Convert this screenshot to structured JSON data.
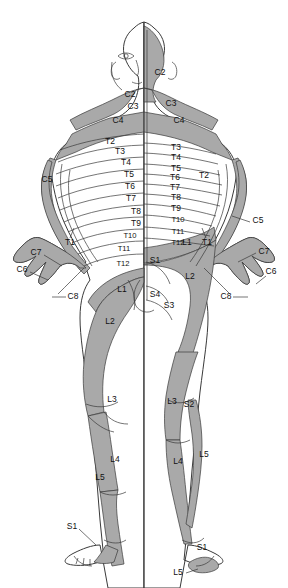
{
  "figure": {
    "view_left": "anterior",
    "view_right": "posterior",
    "colors": {
      "background": "#ffffff",
      "shaded_dermatome": "#a9a9a9",
      "unshaded_dermatome": "#ffffff",
      "outline": "#3a3a3a",
      "label_text": "#111111"
    }
  },
  "labels": {
    "head_neck": [
      {
        "id": "c2-right",
        "text": "C2",
        "x": 160,
        "y": 73
      },
      {
        "id": "c2-left",
        "text": "C2",
        "x": 130,
        "y": 95
      },
      {
        "id": "c3-left",
        "text": "C3",
        "x": 133,
        "y": 107
      },
      {
        "id": "c3-right",
        "text": "C3",
        "x": 171,
        "y": 104
      },
      {
        "id": "c4-left",
        "text": "C4",
        "x": 118,
        "y": 121
      },
      {
        "id": "c4-right",
        "text": "C4",
        "x": 179,
        "y": 121
      }
    ],
    "thoracic_left": [
      {
        "id": "t2-l",
        "text": "T2",
        "x": 110,
        "y": 142
      },
      {
        "id": "t3-l",
        "text": "T3",
        "x": 120,
        "y": 152
      },
      {
        "id": "t4-l",
        "text": "T4",
        "x": 126,
        "y": 163
      },
      {
        "id": "t5-l",
        "text": "T5",
        "x": 129,
        "y": 175
      },
      {
        "id": "t6-l",
        "text": "T6",
        "x": 130,
        "y": 187
      },
      {
        "id": "t7-l",
        "text": "T7",
        "x": 131,
        "y": 199
      },
      {
        "id": "t8-l",
        "text": "T8",
        "x": 136,
        "y": 212
      },
      {
        "id": "t9-l",
        "text": "T9",
        "x": 136,
        "y": 224
      },
      {
        "id": "t10-l",
        "text": "T10",
        "x": 130,
        "y": 236
      },
      {
        "id": "t11-l",
        "text": "T11",
        "x": 124,
        "y": 249
      },
      {
        "id": "t12-l",
        "text": "T12",
        "x": 123,
        "y": 264
      }
    ],
    "thoracic_right": [
      {
        "id": "t3-r",
        "text": "T3",
        "x": 176,
        "y": 148
      },
      {
        "id": "t4-r",
        "text": "T4",
        "x": 176,
        "y": 158
      },
      {
        "id": "t5-r",
        "text": "T5",
        "x": 176,
        "y": 169
      },
      {
        "id": "t6-r",
        "text": "T6",
        "x": 175,
        "y": 178
      },
      {
        "id": "t7-r",
        "text": "T7",
        "x": 175,
        "y": 188
      },
      {
        "id": "t8-r",
        "text": "T8",
        "x": 176,
        "y": 198
      },
      {
        "id": "t9-r",
        "text": "T9",
        "x": 176,
        "y": 209
      },
      {
        "id": "t10-r",
        "text": "T10",
        "x": 178,
        "y": 220
      },
      {
        "id": "t11-r",
        "text": "T11",
        "x": 178,
        "y": 232
      },
      {
        "id": "t12-r",
        "text": "T12",
        "x": 178,
        "y": 243
      }
    ],
    "arms_left": [
      {
        "id": "c5-la",
        "text": "C5",
        "x": 47,
        "y": 180
      },
      {
        "id": "t1-la",
        "text": "T1",
        "x": 70,
        "y": 243
      },
      {
        "id": "c7-la",
        "text": "C7",
        "x": 36,
        "y": 253
      },
      {
        "id": "c6-la",
        "text": "C6",
        "x": 22,
        "y": 270
      },
      {
        "id": "c8-la",
        "text": "C8",
        "x": 73,
        "y": 297
      }
    ],
    "arms_right": [
      {
        "id": "t2-ra",
        "text": "T2",
        "x": 204,
        "y": 176
      },
      {
        "id": "c5-ra",
        "text": "C5",
        "x": 258,
        "y": 221
      },
      {
        "id": "t1-ra",
        "text": "T1",
        "x": 207,
        "y": 243
      },
      {
        "id": "c7-ra",
        "text": "C7",
        "x": 264,
        "y": 252
      },
      {
        "id": "c6-ra",
        "text": "C6",
        "x": 271,
        "y": 272
      },
      {
        "id": "c8-ra",
        "text": "C8",
        "x": 226,
        "y": 297
      }
    ],
    "pelvis": [
      {
        "id": "l1-l",
        "text": "L1",
        "x": 122,
        "y": 290
      },
      {
        "id": "l1-r",
        "text": "L1",
        "x": 187,
        "y": 243
      },
      {
        "id": "s1-r",
        "text": "S1",
        "x": 155,
        "y": 261
      },
      {
        "id": "l2-r",
        "text": "L2",
        "x": 190,
        "y": 277
      },
      {
        "id": "s4-r",
        "text": "S4",
        "x": 155,
        "y": 295
      },
      {
        "id": "s3-r",
        "text": "S3",
        "x": 169,
        "y": 306
      }
    ],
    "legs_left": [
      {
        "id": "l2-ll",
        "text": "L2",
        "x": 110,
        "y": 322
      },
      {
        "id": "l3-ll",
        "text": "L3",
        "x": 112,
        "y": 400
      },
      {
        "id": "l4-ll",
        "text": "L4",
        "x": 115,
        "y": 460
      },
      {
        "id": "l5-ll",
        "text": "L5",
        "x": 100,
        "y": 478
      },
      {
        "id": "s1-lf",
        "text": "S1",
        "x": 72,
        "y": 527
      }
    ],
    "legs_right": [
      {
        "id": "l3-rl",
        "text": "L3",
        "x": 172,
        "y": 402
      },
      {
        "id": "s2-rl",
        "text": "S2",
        "x": 189,
        "y": 405
      },
      {
        "id": "l4-rl",
        "text": "L4",
        "x": 178,
        "y": 462
      },
      {
        "id": "l5-rl",
        "text": "L5",
        "x": 204,
        "y": 455
      },
      {
        "id": "s1-rf",
        "text": "S1",
        "x": 202,
        "y": 548
      },
      {
        "id": "l5-rf",
        "text": "L5",
        "x": 178,
        "y": 573
      }
    ]
  }
}
